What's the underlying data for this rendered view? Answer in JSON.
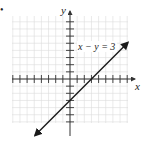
{
  "figure": {
    "bullet": "•",
    "equation_label": "x − y = 3",
    "x_axis_label": "x",
    "y_axis_label": "y"
  },
  "colors": {
    "grid": "#d9d9d9",
    "axis": "#333333",
    "line": "#1a1a1a",
    "text": "#222222",
    "background": "#ffffff"
  },
  "chart_data": {
    "type": "line",
    "title": "",
    "xlabel": "x",
    "ylabel": "y",
    "grid": true,
    "xlim": [
      -8,
      8
    ],
    "ylim": [
      -6,
      9
    ],
    "x_ticks": [
      -8,
      -7,
      -6,
      -5,
      -4,
      -3,
      -2,
      -1,
      1,
      2,
      3,
      4,
      5,
      6,
      7,
      8
    ],
    "y_ticks": [
      -6,
      -5,
      -4,
      -3,
      -2,
      -1,
      1,
      2,
      3,
      4,
      5,
      6,
      7,
      8,
      9
    ],
    "series": [
      {
        "name": "x − y = 3",
        "equation": "y = x - 3",
        "slope": 1,
        "y_intercept": -3,
        "x_intercept": 3,
        "x": [
          -5,
          8
        ],
        "y": [
          -8,
          5
        ],
        "arrows": "both"
      }
    ],
    "annotations": [
      {
        "text": "x − y = 3",
        "x": 1,
        "y": 4.3
      }
    ]
  }
}
